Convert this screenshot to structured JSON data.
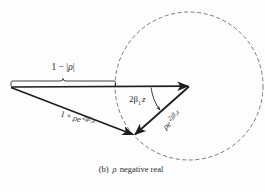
{
  "figure": {
    "caption_prefix": "(b)",
    "caption_symbol": "ρ",
    "caption_text": "negative real",
    "caption_full": "(b) ρ negative real",
    "background_color": "#fdfdfd",
    "ink_color": "#2a2a2a"
  },
  "labels": {
    "brace_label": {
      "lead": "1 − |",
      "rho": "ρ",
      "tail": "|",
      "full": "1 − |ρ|"
    },
    "angle_label": {
      "main": "2β",
      "sub": "1",
      "tail": "z",
      "full": "2β₁z"
    },
    "reflected_label": {
      "base": "ρe",
      "exponent": "2jβ₁z",
      "full": "ρe^{2jβ₁z}"
    },
    "sum_label": {
      "lead": "1 + ",
      "base": "ρe",
      "exponent": "2jβ₁z",
      "full": "1 + ρe^{2jβ₁z}"
    }
  },
  "geometry": {
    "origin": [
      11,
      87
    ],
    "unit_tip": [
      189,
      86
    ],
    "sum_tip": [
      134,
      135
    ],
    "circle_center": [
      189,
      86
    ],
    "circle_radius": 74,
    "brace_span": [
      11,
      116
    ]
  },
  "elements": [
    {
      "name": "unit-phasor-arrow",
      "description": "horizontal vector of length 1"
    },
    {
      "name": "reflection-phasor-arrow",
      "description": "vector ρe^{2jβ₁z} rotating on dashed circle"
    },
    {
      "name": "sum-phasor-arrow",
      "description": "resultant vector 1 + ρe^{2jβ₁z}"
    },
    {
      "name": "locus-circle",
      "description": "dashed circle of radius |ρ|"
    },
    {
      "name": "angle-arc",
      "description": "angle 2β₁z"
    },
    {
      "name": "brace",
      "description": "distance 1 − |ρ|"
    }
  ]
}
